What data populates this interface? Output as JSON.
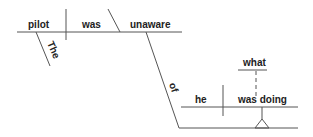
{
  "diagram": {
    "type": "reed-kellogg-sentence-diagram",
    "sentence_words": {
      "subject": "pilot",
      "verb": "was",
      "predicate_adjective": "unaware",
      "article": "The",
      "preposition": "of",
      "clause_subject": "he",
      "clause_verb": "was doing",
      "clause_object": "what"
    },
    "colors": {
      "line": "#555555",
      "text": "#222222",
      "background": "#ffffff"
    }
  }
}
